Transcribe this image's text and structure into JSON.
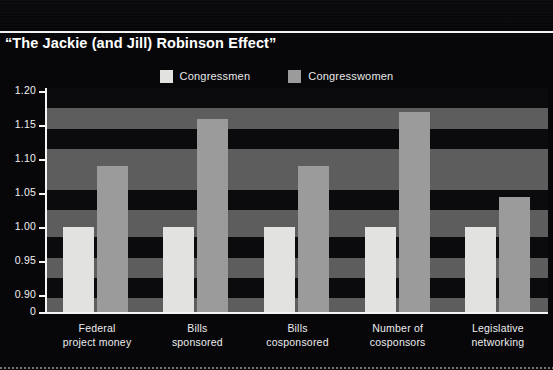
{
  "chart_data": {
    "type": "bar",
    "title": "“The Jackie (and Jill) Robinson Effect”",
    "xlabel": "",
    "ylabel": "",
    "ylim": [
      0.875,
      1.205
    ],
    "yticks": [
      "1.20",
      "1.15",
      "1.10",
      "1.05",
      "1.00",
      "0.95",
      "0.90",
      "0"
    ],
    "ytick_values": [
      1.2,
      1.15,
      1.1,
      1.05,
      1.0,
      0.95,
      0.9,
      0
    ],
    "axis_break": true,
    "grid": false,
    "legend_position": "top-center",
    "categories": [
      "Federal\nproject money",
      "Bills\nsponsored",
      "Bills\ncosponsored",
      "Number of\ncosponsors",
      "Legislative\nnetworking"
    ],
    "category_lines": [
      [
        "Federal",
        "project money"
      ],
      [
        "Bills",
        "sponsored"
      ],
      [
        "Bills",
        "cosponsored"
      ],
      [
        "Number of",
        "cosponsors"
      ],
      [
        "Legislative",
        "networking"
      ]
    ],
    "series": [
      {
        "name": "Congressmen",
        "color": "#e2e2e0",
        "values": [
          1.0,
          1.0,
          1.0,
          1.0,
          1.0
        ]
      },
      {
        "name": "Congresswomen",
        "color": "#9b9b9b",
        "values": [
          1.09,
          1.16,
          1.09,
          1.17,
          1.045
        ]
      }
    ],
    "background_bands": [
      {
        "from": 1.205,
        "to": 1.175,
        "color": "#0b0b0e"
      },
      {
        "from": 1.175,
        "to": 1.145,
        "color": "#5d5d5d"
      },
      {
        "from": 1.145,
        "to": 1.115,
        "color": "#0b0b0e"
      },
      {
        "from": 1.115,
        "to": 1.055,
        "color": "#5d5d5d"
      },
      {
        "from": 1.055,
        "to": 1.025,
        "color": "#0b0b0e"
      },
      {
        "from": 1.025,
        "to": 0.985,
        "color": "#5d5d5d"
      },
      {
        "from": 0.985,
        "to": 0.955,
        "color": "#0b0b0e"
      },
      {
        "from": 0.955,
        "to": 0.925,
        "color": "#5d5d5d"
      },
      {
        "from": 0.925,
        "to": 0.895,
        "color": "#0b0b0e"
      },
      {
        "from": 0.895,
        "to": 0.875,
        "color": "#5d5d5d"
      }
    ]
  },
  "legend": {
    "items": [
      {
        "label": "Congressmen",
        "color": "#e2e2e0"
      },
      {
        "label": "Congresswomen",
        "color": "#9b9b9b"
      }
    ]
  },
  "colors": {
    "background": "#07070a",
    "text": "#ffffff",
    "axis": "#f4f4f4",
    "band_dark": "#0b0b0e",
    "band_light": "#5d5d5d",
    "bar_men": "#e2e2e0",
    "bar_women": "#9b9b9b"
  }
}
